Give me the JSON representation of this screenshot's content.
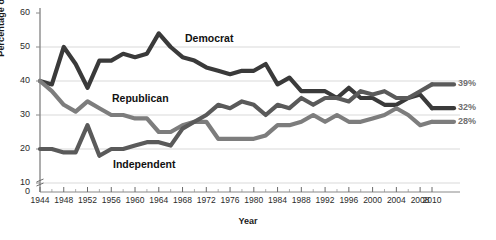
{
  "chart_data": {
    "type": "line",
    "title": "",
    "xlabel": "Year",
    "ylabel": "Percentage of Voters",
    "ylim": [
      0,
      60
    ],
    "yticks": [
      0,
      10,
      20,
      30,
      40,
      50,
      60
    ],
    "ytick_labels": [
      "0",
      "10",
      "20",
      "30",
      "40",
      "50",
      "60"
    ],
    "y_axis_break": true,
    "xlim": [
      1944,
      2010
    ],
    "xticks": [
      1944,
      1948,
      1952,
      1956,
      1960,
      1964,
      1968,
      1972,
      1976,
      1980,
      1984,
      1988,
      1992,
      1996,
      2000,
      2004,
      2008,
      2010
    ],
    "xtick_labels": [
      "1944",
      "1948",
      "1952",
      "1956",
      "1960",
      "1964",
      "1968",
      "1972",
      "1976",
      "1980",
      "1984",
      "1988",
      "1992",
      "1996",
      "2000",
      "2004",
      "2008",
      "2010"
    ],
    "minor_xtick_interval": 2,
    "grid": "horizontal",
    "legend_position": "inline-annotations",
    "x": [
      1944,
      1946,
      1948,
      1950,
      1952,
      1954,
      1956,
      1958,
      1960,
      1962,
      1964,
      1966,
      1968,
      1970,
      1972,
      1974,
      1976,
      1978,
      1980,
      1982,
      1984,
      1986,
      1988,
      1990,
      1992,
      1994,
      1996,
      1998,
      2000,
      2002,
      2004,
      2006,
      2008,
      2010
    ],
    "series": [
      {
        "name": "Democrat",
        "color": "#3a3a3a",
        "end_label": "32%",
        "values": [
          40,
          39,
          50,
          45,
          38,
          46,
          46,
          48,
          47,
          48,
          54,
          50,
          47,
          46,
          44,
          43,
          42,
          43,
          43,
          45,
          39,
          41,
          37,
          37,
          37,
          35,
          38,
          35,
          35,
          33,
          33,
          35,
          36,
          32
        ]
      },
      {
        "name": "Republican",
        "color": "#7d7d7d",
        "end_label": "28%",
        "values": [
          40,
          37,
          33,
          31,
          34,
          32,
          30,
          30,
          29,
          29,
          25,
          25,
          27,
          28,
          28,
          23,
          23,
          23,
          23,
          24,
          27,
          27,
          28,
          30,
          28,
          30,
          28,
          28,
          29,
          30,
          32,
          30,
          27,
          28
        ]
      },
      {
        "name": "Independent",
        "color": "#5a5a5a",
        "end_label": "39%",
        "values": [
          20,
          20,
          19,
          19,
          27,
          18,
          20,
          20,
          21,
          22,
          22,
          21,
          26,
          28,
          30,
          33,
          32,
          34,
          33,
          30,
          33,
          32,
          35,
          33,
          35,
          35,
          34,
          37,
          36,
          37,
          35,
          35,
          37,
          39
        ]
      }
    ],
    "annotations": [
      {
        "text": "Democrat",
        "x_px": 185,
        "y_px": 32
      },
      {
        "text": "Republican",
        "x_px": 112,
        "y_px": 92
      },
      {
        "text": "Independent",
        "x_px": 113,
        "y_px": 158
      }
    ],
    "end_labels": [
      {
        "text": "39%",
        "value": 39,
        "series": "Independent"
      },
      {
        "text": "32%",
        "value": 32,
        "series": "Democrat"
      },
      {
        "text": "28%",
        "value": 28,
        "series": "Republican"
      }
    ]
  }
}
